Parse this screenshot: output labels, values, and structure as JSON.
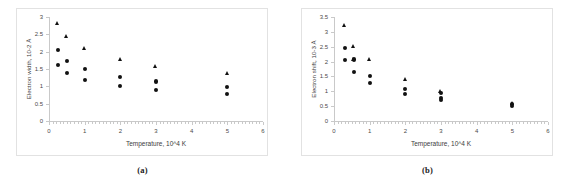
{
  "figure": {
    "panels": [
      {
        "caption": "(a)",
        "chart_data": {
          "type": "scatter",
          "title": "",
          "xlabel": "Temperature, 10^4 K",
          "ylabel": "Electron width, 10-2 Å",
          "xlim": [
            0,
            6
          ],
          "ylim": [
            0,
            3
          ],
          "xticks": [
            0,
            1,
            2,
            3,
            4,
            5,
            6
          ],
          "xtick_labels": [
            "0",
            "1",
            "2",
            "3",
            "4",
            "5",
            "6"
          ],
          "yticks": [
            0,
            0.5,
            1,
            1.5,
            2,
            2.5,
            3
          ],
          "ytick_labels": [
            "0",
            "0.5",
            "1",
            "1.5",
            "2",
            "2.5",
            "3"
          ],
          "grid": false,
          "legend": "none",
          "series": [
            {
              "name": "triangle-series",
              "marker": "triangle",
              "color": "#111111",
              "points": [
                {
                  "x": 0.25,
                  "y": 2.82
                },
                {
                  "x": 0.5,
                  "y": 2.44
                },
                {
                  "x": 1.0,
                  "y": 2.08
                },
                {
                  "x": 2.0,
                  "y": 1.76
                },
                {
                  "x": 3.0,
                  "y": 1.56
                },
                {
                  "x": 5.0,
                  "y": 1.36
                }
              ]
            },
            {
              "name": "circle-series",
              "marker": "circle",
              "color": "#111111",
              "points": [
                {
                  "x": 0.25,
                  "y": 2.05
                },
                {
                  "x": 0.25,
                  "y": 1.62
                },
                {
                  "x": 0.5,
                  "y": 1.74
                },
                {
                  "x": 0.5,
                  "y": 1.39
                },
                {
                  "x": 1.0,
                  "y": 1.49
                },
                {
                  "x": 1.0,
                  "y": 1.19
                },
                {
                  "x": 2.0,
                  "y": 1.27
                },
                {
                  "x": 2.0,
                  "y": 1.01
                },
                {
                  "x": 3.0,
                  "y": 1.14
                },
                {
                  "x": 3.0,
                  "y": 0.89
                },
                {
                  "x": 5.0,
                  "y": 0.99
                },
                {
                  "x": 5.0,
                  "y": 0.78
                }
              ]
            }
          ]
        }
      },
      {
        "caption": "(b)",
        "chart_data": {
          "type": "scatter",
          "title": "",
          "xlabel": "Temperature, 10^4 K",
          "ylabel": "Electron shift, 10-3 Å",
          "xlim": [
            0,
            6
          ],
          "ylim": [
            0,
            3.5
          ],
          "xticks": [
            0,
            1,
            2,
            3,
            4,
            5,
            6
          ],
          "xtick_labels": [
            "0",
            "1",
            "2",
            "3",
            "4",
            "5",
            "6"
          ],
          "yticks": [
            0,
            0.5,
            1,
            1.5,
            2,
            2.5,
            3,
            3.5
          ],
          "ytick_labels": [
            "0",
            "0.5",
            "1",
            "1.5",
            "2",
            "2.5",
            "3",
            "3.5"
          ],
          "grid": false,
          "legend": "none",
          "series": [
            {
              "name": "triangle-series",
              "marker": "triangle",
              "color": "#111111",
              "points": [
                {
                  "x": 0.3,
                  "y": 3.2
                },
                {
                  "x": 0.55,
                  "y": 2.5
                },
                {
                  "x": 0.55,
                  "y": 2.07
                },
                {
                  "x": 1.0,
                  "y": 2.05
                },
                {
                  "x": 2.0,
                  "y": 1.4
                },
                {
                  "x": 3.0,
                  "y": 1.0
                },
                {
                  "x": 5.0,
                  "y": 0.6
                }
              ]
            },
            {
              "name": "circle-series",
              "marker": "circle",
              "color": "#111111",
              "points": [
                {
                  "x": 0.3,
                  "y": 2.47
                },
                {
                  "x": 0.3,
                  "y": 2.04
                },
                {
                  "x": 0.55,
                  "y": 2.07
                },
                {
                  "x": 0.55,
                  "y": 1.66
                },
                {
                  "x": 1.0,
                  "y": 1.52
                },
                {
                  "x": 1.0,
                  "y": 1.28
                },
                {
                  "x": 2.0,
                  "y": 1.08
                },
                {
                  "x": 2.0,
                  "y": 0.92
                },
                {
                  "x": 3.0,
                  "y": 0.95
                },
                {
                  "x": 3.0,
                  "y": 0.78
                },
                {
                  "x": 3.0,
                  "y": 0.72
                },
                {
                  "x": 5.0,
                  "y": 0.56
                },
                {
                  "x": 5.0,
                  "y": 0.5
                }
              ]
            }
          ]
        }
      }
    ]
  }
}
